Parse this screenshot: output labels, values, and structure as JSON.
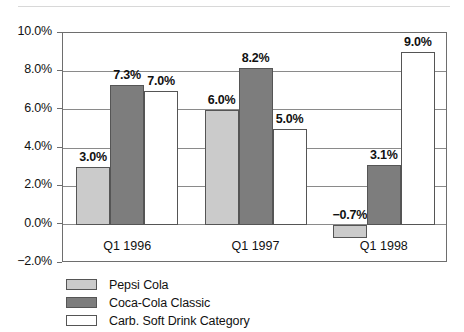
{
  "chart_data": {
    "type": "bar",
    "title": "",
    "subtitle": "",
    "xlabel": "",
    "ylabel": "",
    "categories": [
      "Q1 1996",
      "Q1 1997",
      "Q1 1998"
    ],
    "series": [
      {
        "name": "Pepsi Cola",
        "color": "#cbcbcb",
        "values": [
          3.0,
          6.0,
          -0.7
        ],
        "labels": [
          "3.0%",
          "6.0%",
          "−0.7%"
        ]
      },
      {
        "name": "Coca-Cola Classic",
        "color": "#7d7d7d",
        "values": [
          7.3,
          8.2,
          3.1
        ],
        "labels": [
          "7.3%",
          "8.2%",
          "3.1%"
        ]
      },
      {
        "name": "Carb. Soft Drink Category",
        "color": "#ffffff",
        "values": [
          7.0,
          5.0,
          9.0
        ],
        "labels": [
          "7.0%",
          "5.0%",
          "9.0%"
        ]
      }
    ],
    "ylim": [
      -2.0,
      10.0
    ],
    "ytick_values": [
      10.0,
      8.0,
      6.0,
      4.0,
      2.0,
      0.0,
      -2.0
    ],
    "ytick_labels": [
      "10.0%",
      "8.0%",
      "6.0%",
      "4.0%",
      "2.0%",
      "0.0%",
      "−2.0%"
    ],
    "grid": true,
    "legend_position": "bottom-left",
    "value_labels_shown": true
  },
  "decor": {
    "top_rule": "horizontal-rule"
  }
}
